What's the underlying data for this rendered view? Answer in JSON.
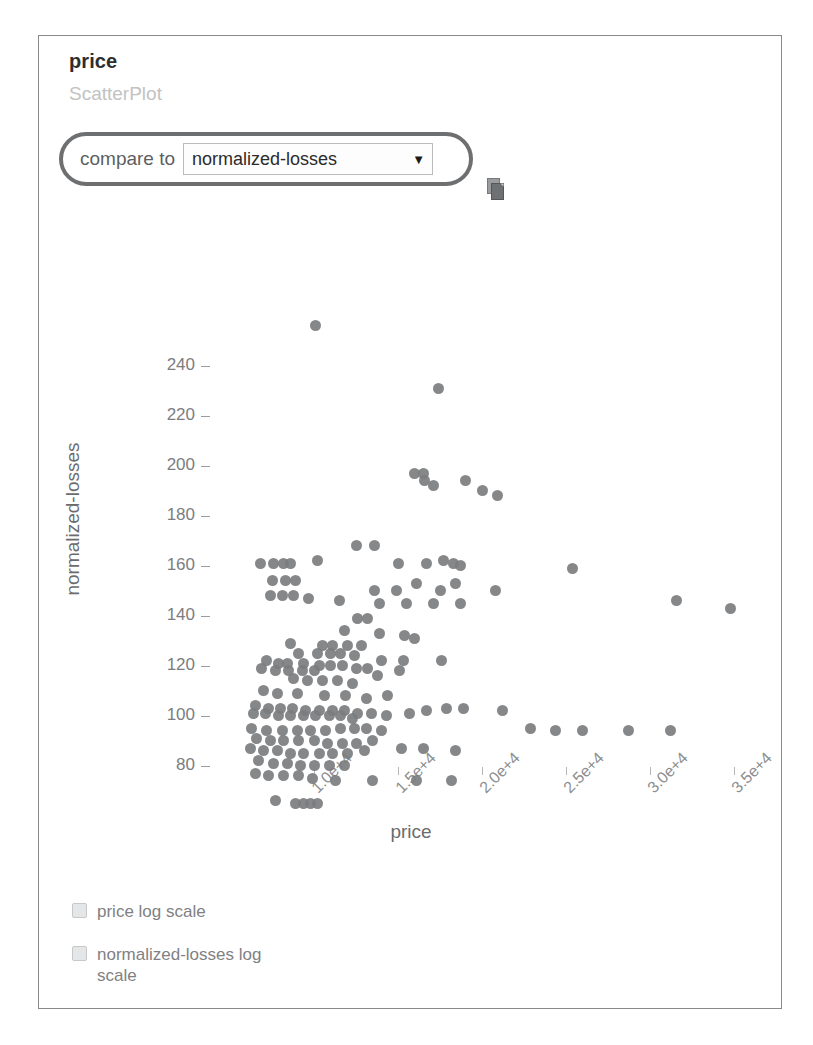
{
  "panel": {
    "title": "price",
    "subtitle": "ScatterPlot"
  },
  "controls": {
    "compare_label": "compare to",
    "select_value": "normalized-losses",
    "select_arrow": "▼",
    "doc_icon_name": "copy-document-icon",
    "options": [
      "normalized-losses"
    ]
  },
  "checkboxes": [
    {
      "label": "price log scale",
      "checked": false
    },
    {
      "label": "normalized-losses log scale",
      "checked": false
    }
  ],
  "colors": {
    "point": "#7b7d7f",
    "axis_text": "#7b7d7f",
    "title": "#2e2e2e",
    "subtitle": "#c2c2c2",
    "highlight_border": "#6d6f71",
    "panel_border": "#888a8c"
  },
  "chart_data": {
    "type": "scatter",
    "title": "price",
    "subtitle": "ScatterPlot",
    "xlabel": "price",
    "ylabel": "normalized-losses",
    "xlim": [
      5000,
      37500
    ],
    "ylim": [
      60,
      265
    ],
    "grid": false,
    "legend": null,
    "xticks": [
      10000,
      15000,
      20000,
      25000,
      30000,
      35000
    ],
    "xticklabels": [
      "1.0e+4",
      "1.5e+4",
      "2.0e+4",
      "2.5e+4",
      "3.0e+4",
      "3.5e+4"
    ],
    "yticks": [
      80,
      100,
      120,
      140,
      160,
      180,
      200,
      220,
      240
    ],
    "yticklabels": [
      "80",
      "100",
      "120",
      "140",
      "160",
      "180",
      "200",
      "220",
      "240"
    ],
    "marker": "circle",
    "marker_color": "#7b7d7f",
    "points": [
      [
        10100,
        256
      ],
      [
        17400,
        231
      ],
      [
        16000,
        197
      ],
      [
        16500,
        197
      ],
      [
        16600,
        194
      ],
      [
        17100,
        192
      ],
      [
        19000,
        194
      ],
      [
        20000,
        190
      ],
      [
        20900,
        188
      ],
      [
        12500,
        168
      ],
      [
        13600,
        168
      ],
      [
        6800,
        161
      ],
      [
        7600,
        161
      ],
      [
        8200,
        161
      ],
      [
        8600,
        161
      ],
      [
        10200,
        162
      ],
      [
        15000,
        161
      ],
      [
        16700,
        161
      ],
      [
        17700,
        162
      ],
      [
        18300,
        161
      ],
      [
        18700,
        160
      ],
      [
        25400,
        159
      ],
      [
        7500,
        154
      ],
      [
        8300,
        154
      ],
      [
        8900,
        154
      ],
      [
        13600,
        150
      ],
      [
        14900,
        150
      ],
      [
        16100,
        153
      ],
      [
        17500,
        150
      ],
      [
        18400,
        153
      ],
      [
        20800,
        150
      ],
      [
        7400,
        148
      ],
      [
        8100,
        148
      ],
      [
        8800,
        148
      ],
      [
        9700,
        147
      ],
      [
        11500,
        146
      ],
      [
        13900,
        145
      ],
      [
        15500,
        145
      ],
      [
        17100,
        145
      ],
      [
        18700,
        145
      ],
      [
        31600,
        146
      ],
      [
        34800,
        143
      ],
      [
        12600,
        139
      ],
      [
        13200,
        139
      ],
      [
        11800,
        134
      ],
      [
        13900,
        133
      ],
      [
        15400,
        132
      ],
      [
        16000,
        131
      ],
      [
        8600,
        129
      ],
      [
        10500,
        128
      ],
      [
        11100,
        128
      ],
      [
        12000,
        128
      ],
      [
        12800,
        128
      ],
      [
        9100,
        125
      ],
      [
        10200,
        125
      ],
      [
        11000,
        125
      ],
      [
        11600,
        125
      ],
      [
        12400,
        124
      ],
      [
        14000,
        122
      ],
      [
        15300,
        122
      ],
      [
        7200,
        122
      ],
      [
        7900,
        121
      ],
      [
        8400,
        121
      ],
      [
        9400,
        121
      ],
      [
        10300,
        120
      ],
      [
        11000,
        120
      ],
      [
        11700,
        120
      ],
      [
        12500,
        119
      ],
      [
        13200,
        119
      ],
      [
        6900,
        119
      ],
      [
        7700,
        118
      ],
      [
        8500,
        118
      ],
      [
        9300,
        118
      ],
      [
        10000,
        118
      ],
      [
        8800,
        115
      ],
      [
        9600,
        114
      ],
      [
        10500,
        114
      ],
      [
        11400,
        114
      ],
      [
        12300,
        113
      ],
      [
        13800,
        116
      ],
      [
        15100,
        118
      ],
      [
        17600,
        122
      ],
      [
        7000,
        110
      ],
      [
        7800,
        109
      ],
      [
        9000,
        109
      ],
      [
        10600,
        108
      ],
      [
        11900,
        108
      ],
      [
        13100,
        107
      ],
      [
        14400,
        108
      ],
      [
        6500,
        104
      ],
      [
        7300,
        103
      ],
      [
        8000,
        103
      ],
      [
        8700,
        103
      ],
      [
        9500,
        102
      ],
      [
        10300,
        102
      ],
      [
        11100,
        102
      ],
      [
        11800,
        102
      ],
      [
        12600,
        101
      ],
      [
        6400,
        101
      ],
      [
        7100,
        101
      ],
      [
        7900,
        100
      ],
      [
        8600,
        100
      ],
      [
        9400,
        100
      ],
      [
        10100,
        100
      ],
      [
        10900,
        100
      ],
      [
        11600,
        100
      ],
      [
        12300,
        99
      ],
      [
        13400,
        101
      ],
      [
        14300,
        100
      ],
      [
        15700,
        101
      ],
      [
        16700,
        102
      ],
      [
        17900,
        103
      ],
      [
        18900,
        103
      ],
      [
        21200,
        102
      ],
      [
        22900,
        95
      ],
      [
        24400,
        94
      ],
      [
        26000,
        94
      ],
      [
        28700,
        94
      ],
      [
        31200,
        94
      ],
      [
        6300,
        95
      ],
      [
        7200,
        94
      ],
      [
        8100,
        94
      ],
      [
        9000,
        94
      ],
      [
        9800,
        94
      ],
      [
        10700,
        94
      ],
      [
        11600,
        95
      ],
      [
        12400,
        95
      ],
      [
        13100,
        95
      ],
      [
        14000,
        94
      ],
      [
        6600,
        91
      ],
      [
        7400,
        90
      ],
      [
        8200,
        90
      ],
      [
        9100,
        90
      ],
      [
        10000,
        90
      ],
      [
        10800,
        89
      ],
      [
        11700,
        89
      ],
      [
        12500,
        89
      ],
      [
        13500,
        90
      ],
      [
        6200,
        87
      ],
      [
        7000,
        86
      ],
      [
        7800,
        86
      ],
      [
        8600,
        85
      ],
      [
        9400,
        85
      ],
      [
        10300,
        85
      ],
      [
        11100,
        85
      ],
      [
        12000,
        85
      ],
      [
        13000,
        86
      ],
      [
        15200,
        87
      ],
      [
        16500,
        87
      ],
      [
        18400,
        86
      ],
      [
        6700,
        82
      ],
      [
        7600,
        81
      ],
      [
        8400,
        81
      ],
      [
        9200,
        80
      ],
      [
        10000,
        80
      ],
      [
        10900,
        80
      ],
      [
        11800,
        80
      ],
      [
        6500,
        77
      ],
      [
        7300,
        76
      ],
      [
        8200,
        76
      ],
      [
        9100,
        76
      ],
      [
        9900,
        75
      ],
      [
        11300,
        74
      ],
      [
        13500,
        74
      ],
      [
        16100,
        74
      ],
      [
        18200,
        74
      ],
      [
        7700,
        66
      ],
      [
        8900,
        65
      ],
      [
        9400,
        65
      ],
      [
        9800,
        65
      ],
      [
        10200,
        65
      ]
    ]
  }
}
